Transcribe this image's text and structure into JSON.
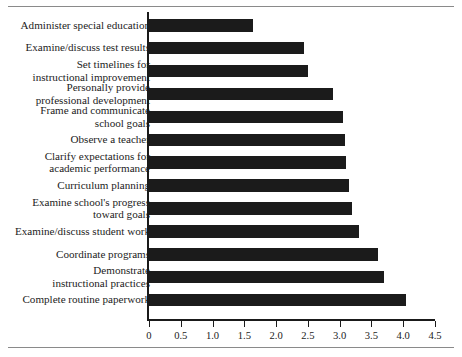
{
  "figure": {
    "has_top_rule": true,
    "has_bottom_rule": true,
    "line_color": "#8a8a8a",
    "bar_color": "#1b1b1b",
    "axis_color": "#1a1a1a",
    "text_color": "#1c1c1c"
  },
  "chart_data": {
    "type": "bar",
    "orientation": "horizontal",
    "title": "",
    "xlabel": "",
    "ylabel": "",
    "xlim": [
      0,
      4.5
    ],
    "grid": false,
    "legend": "none",
    "xticks": [
      0,
      0.5,
      1.0,
      1.5,
      2.0,
      2.5,
      3.0,
      3.5,
      4.0,
      4.5
    ],
    "xtick_labels": [
      "0",
      "0.5",
      "1.0",
      "1.5",
      "2.0",
      "2.5",
      "3.0",
      "3.5",
      "4.0",
      "4.5"
    ],
    "categories": [
      "Administer special education",
      "Examine/discuss test results",
      "Set timelines for\ninstructional improvement",
      "Personally provide\nprofessional development",
      "Frame and communicate\nschool goals",
      "Observe a teacher",
      "Clarify expectations for\nacademic performance",
      "Curriculum planning",
      "Examine school's progress\ntoward goals",
      "Examine/discuss student work",
      "Coordinate programs",
      "Demonstrate\ninstructional practices",
      "Complete routine paperwork"
    ],
    "values": [
      1.63,
      2.44,
      2.5,
      2.9,
      3.05,
      3.08,
      3.1,
      3.15,
      3.2,
      3.3,
      3.6,
      3.7,
      4.05
    ]
  }
}
